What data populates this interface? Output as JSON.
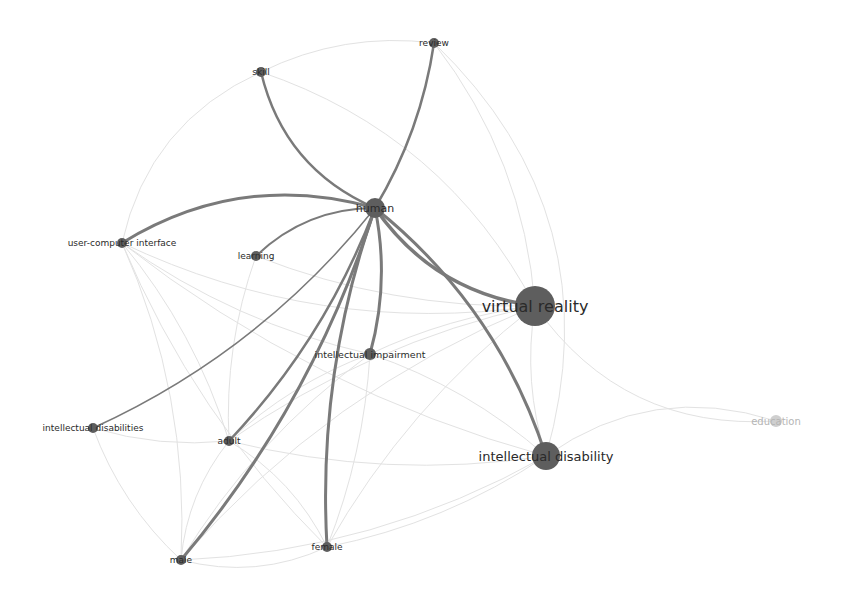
{
  "chart_data": {
    "type": "network",
    "title": "",
    "colors": {
      "node": "#5e5e5e",
      "node_faded": "#cfcfcf",
      "edge_strong": "#7a7a7a",
      "edge_faint": "#e2e2e2",
      "label": "#2a2a2a",
      "label_faded": "#b5b5b5"
    },
    "nodes": [
      {
        "id": "human",
        "label": "human",
        "x": 375,
        "y": 208,
        "r": 10,
        "font": 11
      },
      {
        "id": "virtual_reality",
        "label": "virtual reality",
        "x": 535,
        "y": 306,
        "r": 20,
        "font": 16
      },
      {
        "id": "intellectual_disability",
        "label": "intellectual disability",
        "x": 546,
        "y": 456,
        "r": 14,
        "font": 13
      },
      {
        "id": "education",
        "label": "education",
        "x": 776,
        "y": 421,
        "r": 6,
        "font": 10,
        "faded": true
      },
      {
        "id": "review",
        "label": "review",
        "x": 434,
        "y": 43,
        "r": 5,
        "font": 9
      },
      {
        "id": "skill",
        "label": "skill",
        "x": 261,
        "y": 72,
        "r": 5,
        "font": 9
      },
      {
        "id": "user_computer_interface",
        "label": "user-computer interface",
        "x": 122,
        "y": 243,
        "r": 5,
        "font": 9
      },
      {
        "id": "learning",
        "label": "learning",
        "x": 256,
        "y": 256,
        "r": 5,
        "font": 9
      },
      {
        "id": "intellectual_impairment",
        "label": "intellectual impairment",
        "x": 370,
        "y": 354,
        "r": 6,
        "font": 9.5
      },
      {
        "id": "intellectual_disabilities",
        "label": "intellectual disabilities",
        "x": 93,
        "y": 428,
        "r": 5,
        "font": 9
      },
      {
        "id": "adult",
        "label": "adult",
        "x": 229,
        "y": 441,
        "r": 5,
        "font": 9
      },
      {
        "id": "male",
        "label": "male",
        "x": 181,
        "y": 560,
        "r": 5,
        "font": 9
      },
      {
        "id": "female",
        "label": "female",
        "x": 327,
        "y": 547,
        "r": 5,
        "font": 9
      }
    ],
    "edges_strong": [
      {
        "source": "human",
        "target": "review",
        "width": 2.5,
        "curve": 0.1
      },
      {
        "source": "human",
        "target": "skill",
        "width": 2.5,
        "curve": -0.25
      },
      {
        "source": "human",
        "target": "user_computer_interface",
        "width": 3,
        "curve": 0.22
      },
      {
        "source": "human",
        "target": "learning",
        "width": 2,
        "curve": 0.2
      },
      {
        "source": "human",
        "target": "virtual_reality",
        "width": 3.5,
        "curve": 0.22
      },
      {
        "source": "human",
        "target": "intellectual_disability",
        "width": 3,
        "curve": -0.15
      },
      {
        "source": "human",
        "target": "intellectual_impairment",
        "width": 3,
        "curve": -0.12
      },
      {
        "source": "human",
        "target": "intellectual_disabilities",
        "width": 1.5,
        "curve": -0.12
      },
      {
        "source": "human",
        "target": "adult",
        "width": 2.5,
        "curve": -0.1
      },
      {
        "source": "human",
        "target": "male",
        "width": 3,
        "curve": -0.1
      },
      {
        "source": "human",
        "target": "female",
        "width": 3,
        "curve": 0.1
      }
    ],
    "edges_faint": [
      {
        "source": "virtual_reality",
        "target": "education",
        "curve": 0.28
      },
      {
        "source": "intellectual_disability",
        "target": "education",
        "curve": -0.25
      },
      {
        "source": "virtual_reality",
        "target": "intellectual_disability",
        "curve": 0.12
      },
      {
        "source": "virtual_reality",
        "target": "user_computer_interface",
        "curve": -0.15
      },
      {
        "source": "virtual_reality",
        "target": "intellectual_impairment",
        "curve": 0.08
      },
      {
        "source": "virtual_reality",
        "target": "adult",
        "curve": 0.1
      },
      {
        "source": "virtual_reality",
        "target": "male",
        "curve": 0.12
      },
      {
        "source": "virtual_reality",
        "target": "female",
        "curve": 0.1
      },
      {
        "source": "virtual_reality",
        "target": "skill",
        "curve": 0.2
      },
      {
        "source": "virtual_reality",
        "target": "review",
        "curve": 0.15
      },
      {
        "source": "virtual_reality",
        "target": "learning",
        "curve": -0.1
      },
      {
        "source": "intellectual_disability",
        "target": "adult",
        "curve": -0.1
      },
      {
        "source": "intellectual_disability",
        "target": "male",
        "curve": -0.12
      },
      {
        "source": "intellectual_disability",
        "target": "female",
        "curve": -0.1
      },
      {
        "source": "intellectual_disability",
        "target": "intellectual_impairment",
        "curve": 0.1
      },
      {
        "source": "intellectual_disability",
        "target": "user_computer_interface",
        "curve": -0.1
      },
      {
        "source": "intellectual_impairment",
        "target": "adult",
        "curve": 0.1
      },
      {
        "source": "intellectual_impairment",
        "target": "male",
        "curve": 0.1
      },
      {
        "source": "intellectual_impairment",
        "target": "female",
        "curve": -0.08
      },
      {
        "source": "intellectual_impairment",
        "target": "user_computer_interface",
        "curve": -0.1
      },
      {
        "source": "adult",
        "target": "male",
        "curve": 0.15
      },
      {
        "source": "adult",
        "target": "female",
        "curve": -0.15
      },
      {
        "source": "male",
        "target": "female",
        "curve": 0.18
      },
      {
        "source": "adult",
        "target": "user_computer_interface",
        "curve": 0.1
      },
      {
        "source": "male",
        "target": "user_computer_interface",
        "curve": 0.12
      },
      {
        "source": "female",
        "target": "user_computer_interface",
        "curve": -0.1
      },
      {
        "source": "intellectual_disabilities",
        "target": "male",
        "curve": 0.12
      },
      {
        "source": "intellectual_disabilities",
        "target": "adult",
        "curve": 0.1
      },
      {
        "source": "skill",
        "target": "user_computer_interface",
        "curve": 0.25
      },
      {
        "source": "skill",
        "target": "review",
        "curve": -0.15
      },
      {
        "source": "learning",
        "target": "adult",
        "curve": 0.1
      },
      {
        "source": "review",
        "target": "intellectual_disability",
        "curve": -0.3
      }
    ]
  }
}
